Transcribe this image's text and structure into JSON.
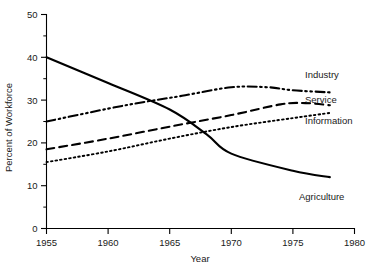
{
  "chart_data": {
    "type": "line",
    "title": "",
    "xlabel": "Year",
    "ylabel": "Percent of Workforce",
    "xlim": [
      1955,
      1980
    ],
    "ylim": [
      0,
      50
    ],
    "grid": false,
    "legend_position": "right-inline-labels",
    "x_ticks": [
      1955,
      1960,
      1965,
      1970,
      1975,
      1980
    ],
    "x_tick_labels": [
      "1955",
      "1960",
      "1965",
      "1970",
      "1975",
      "1980"
    ],
    "x_minor_ticks": [],
    "y_ticks": [
      0,
      10,
      20,
      30,
      40,
      50
    ],
    "y_tick_labels": [
      "0",
      "10",
      "20",
      "30",
      "40",
      "50"
    ],
    "y_minor_ticks": [
      5,
      15,
      25,
      35,
      45
    ],
    "series": [
      {
        "name": "Agriculture",
        "label": "Agriculture",
        "style": "solid",
        "stroke_width": 2.1,
        "color": "#000000",
        "x": [
          1955,
          1960,
          1965,
          1968,
          1970,
          1975,
          1978
        ],
        "values": [
          40.0,
          34.0,
          27.8,
          22.0,
          17.5,
          13.5,
          12.0
        ]
      },
      {
        "name": "Industry",
        "label": "Industry",
        "style": "dash-dot-dot",
        "stroke_width": 2.1,
        "color": "#000000",
        "x": [
          1955,
          1960,
          1963,
          1966,
          1970,
          1973,
          1975,
          1978
        ],
        "values": [
          25.0,
          28.0,
          29.6,
          31.0,
          33.0,
          33.0,
          32.3,
          31.8
        ]
      },
      {
        "name": "Service",
        "label": "Service",
        "style": "dashed",
        "stroke_width": 2.1,
        "color": "#000000",
        "x": [
          1955,
          1960,
          1965,
          1970,
          1974,
          1976,
          1978
        ],
        "values": [
          18.5,
          21.0,
          23.8,
          26.5,
          29.0,
          29.3,
          28.8
        ]
      },
      {
        "name": "Information",
        "label": "Information",
        "style": "dotted",
        "stroke_width": 1.9,
        "color": "#000000",
        "x": [
          1955,
          1960,
          1965,
          1970,
          1975,
          1978
        ],
        "values": [
          15.5,
          18.0,
          21.0,
          23.7,
          25.8,
          27.0
        ]
      }
    ],
    "annotations": [
      {
        "text": "Industry",
        "x_px": 305,
        "y_px": 78
      },
      {
        "text": "Service",
        "x_px": 305,
        "y_px": 103
      },
      {
        "text": "Information",
        "x_px": 305,
        "y_px": 124
      },
      {
        "text": "Agriculture",
        "x_px": 299,
        "y_px": 200
      }
    ]
  },
  "axes": {
    "x_title": "Year",
    "y_title": "Percent of Workforce"
  }
}
